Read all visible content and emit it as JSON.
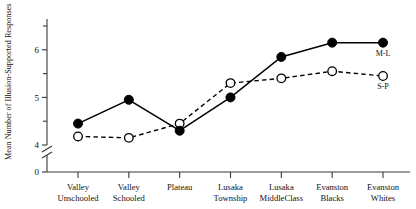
{
  "chart_data": {
    "type": "line",
    "title": "",
    "xlabel": "",
    "ylabel": "Mean Number of Illusion-Supported Responses",
    "ylim": [
      4,
      6.5
    ],
    "y_axis_break": true,
    "y_zero_label": "0",
    "yticks_major": [
      4,
      5,
      6
    ],
    "ytick_labels": [
      "4",
      "5",
      "6"
    ],
    "yticks_minor": [
      4.5,
      5.5,
      6.5
    ],
    "grid": false,
    "legend_position": "inline-right",
    "categories": [
      "Valley Unschooled",
      "Valley Schooled",
      "Plateau",
      "Lusaka Township",
      "Lusaka MiddleClass",
      "Evanston Blacks",
      "Evanston Whites"
    ],
    "category_lines": [
      [
        "Valley",
        "Unschooled"
      ],
      [
        "Valley",
        "Schooled"
      ],
      [
        "Plateau",
        ""
      ],
      [
        "Lusaka",
        "Township"
      ],
      [
        "Lusaka",
        "MiddleClass"
      ],
      [
        "Evanston",
        "Blacks"
      ],
      [
        "Evanston",
        "Whites"
      ]
    ],
    "series": [
      {
        "name": "M-L",
        "marker": "filled-circle",
        "linestyle": "solid",
        "color": "#000000",
        "values": [
          4.45,
          4.95,
          4.3,
          5.0,
          5.85,
          6.15,
          6.15
        ]
      },
      {
        "name": "S-P",
        "marker": "open-circle",
        "linestyle": "dashed",
        "color": "#000000",
        "values": [
          4.18,
          4.15,
          4.45,
          5.3,
          5.4,
          5.55,
          5.45
        ]
      }
    ]
  },
  "labels": {
    "y_axis_title": "Mean Number of Illusion-Supported Responses",
    "series_ml": "M-L",
    "series_sp": "S-P"
  }
}
